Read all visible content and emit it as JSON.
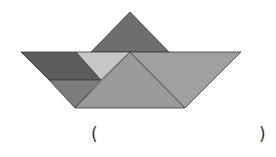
{
  "figure": {
    "pieces": [
      {
        "name": "top-triangle",
        "points": "130,12 91,52 169,52",
        "color": "#6e6e6e"
      },
      {
        "name": "left-parallelogram",
        "points": "21,52 76,52 101,80 49,80",
        "color": "#5c5c5c"
      },
      {
        "name": "light-triangle",
        "points": "76,52 130,52 101,80",
        "color": "#c6c6c6"
      },
      {
        "name": "small-lower-triangle",
        "points": "49,80 101,80 75,108",
        "color": "#7c7c7c"
      },
      {
        "name": "big-center-triangle",
        "points": "130,52 185,108 75,108",
        "color": "#9b9b9b"
      },
      {
        "name": "right-triangle",
        "points": "130,52 241,52 185,108",
        "color": "#a0a0a0"
      }
    ]
  },
  "answer_blank": {
    "open": "(",
    "close": ")"
  }
}
